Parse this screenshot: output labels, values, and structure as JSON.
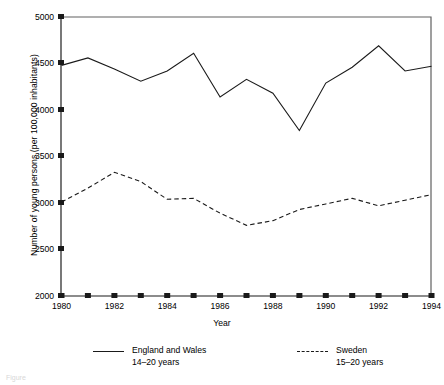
{
  "chart_data": {
    "type": "line",
    "title": "",
    "xlabel": "Year",
    "ylabel": "Number of young persons (per 100,000 inhabitants)",
    "xlim": [
      1980,
      1994
    ],
    "ylim": [
      2000,
      5000
    ],
    "yticks": [
      5000,
      4500,
      4000,
      3500,
      3000,
      2500,
      2000
    ],
    "ytick_labels": [
      "5000",
      "4500",
      "4000",
      "3500",
      "3000",
      "2500",
      "2000"
    ],
    "xticks": [
      1980,
      1981,
      1982,
      1983,
      1984,
      1985,
      1986,
      1987,
      1988,
      1989,
      1990,
      1991,
      1992,
      1993,
      1994
    ],
    "xtick_labels_shown": [
      "1980",
      "1982",
      "1984",
      "1986",
      "1988",
      "1990",
      "1992",
      "1994"
    ],
    "grid": false,
    "legend_position": "below",
    "x": [
      1980,
      1981,
      1982,
      1983,
      1984,
      1985,
      1986,
      1987,
      1988,
      1989,
      1990,
      1991,
      1992,
      1993,
      1994
    ],
    "series": [
      {
        "name": "England and Wales",
        "sublabel": "14–20 years",
        "style": "solid",
        "color": "#1a1a1a",
        "values": [
          4480,
          4560,
          4440,
          4310,
          4420,
          4610,
          4140,
          4330,
          4180,
          3780,
          4290,
          4460,
          4690,
          4420,
          4470
        ]
      },
      {
        "name": "Sweden",
        "sublabel": "15–20 years",
        "style": "dashed",
        "color": "#1a1a1a",
        "values": [
          3010,
          3160,
          3330,
          3230,
          3040,
          3050,
          2890,
          2760,
          2810,
          2930,
          2990,
          3050,
          2970,
          3030,
          3090
        ]
      }
    ]
  },
  "legend": {
    "entries": [
      {
        "label": "England and Wales",
        "sublabel": "14–20 years"
      },
      {
        "label": "Sweden",
        "sublabel": "15–20 years"
      }
    ]
  },
  "caption": "Figure"
}
